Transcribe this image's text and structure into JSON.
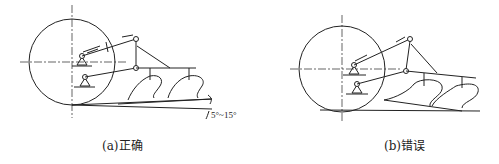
{
  "figures": [
    {
      "id": "a",
      "caption": "(a)正确",
      "verdict": "correct",
      "angle_label": "5°~15°"
    },
    {
      "id": "b",
      "caption": "(b)错误",
      "verdict": "incorrect"
    }
  ],
  "colors": {
    "line": "#222222",
    "background": "#ffffff"
  }
}
